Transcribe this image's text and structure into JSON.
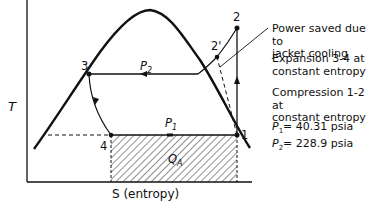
{
  "diagram": {
    "type": "T-S diagram (refrigeration cycle)",
    "axes": {
      "y_label": "T",
      "x_label": "S (entropy)"
    },
    "points": [
      {
        "id": "1",
        "label": "1"
      },
      {
        "id": "2",
        "label": "2"
      },
      {
        "id": "2p",
        "label": "2'"
      },
      {
        "id": "3",
        "label": "3"
      },
      {
        "id": "4",
        "label": "4"
      }
    ],
    "line_labels": {
      "p2": "P",
      "p2_sub": "2",
      "p1": "P",
      "p1_sub": "1",
      "qa": "Q",
      "qa_sub": "A"
    },
    "notes": {
      "jacket_1": "Power saved due to",
      "jacket_2": "jacket cooling",
      "expansion_1": "Expansion 3-4 at",
      "expansion_2": "constant entropy",
      "compression_1": "Compression 1-2 at",
      "compression_2": "constant entropy",
      "p1_label": "P",
      "p1_sub": "1",
      "p1_value": "= 40.31 psia",
      "p2_label": "P",
      "p2_sub": "2",
      "p2_value": "= 228.9 psia"
    }
  }
}
